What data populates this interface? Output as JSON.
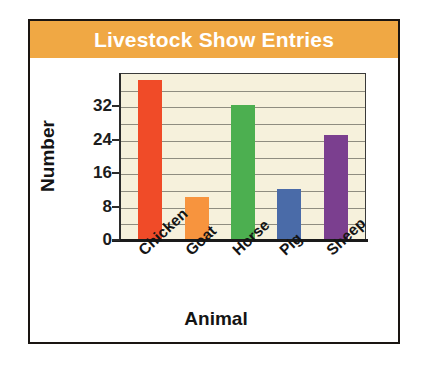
{
  "card": {
    "title": "Livestock Show Entries",
    "title_bar_color": "#F0A844",
    "title_text_color": "#FFFFFF",
    "border_color": "#1A1512",
    "background": "#FFFFFF"
  },
  "chart_data": {
    "type": "bar",
    "title": "Livestock Show Entries",
    "xlabel": "Animal",
    "ylabel": "Number",
    "categories": [
      "Chicken",
      "Goat",
      "Horse",
      "Pig",
      "Sheep"
    ],
    "values": [
      38,
      10,
      32,
      12,
      25
    ],
    "bar_colors": [
      "#F04B28",
      "#F7943E",
      "#4CAF50",
      "#4A6BA8",
      "#7B3F8F"
    ],
    "ytick_labels": [
      "0",
      "8",
      "16",
      "24",
      "32"
    ],
    "ytick_values": [
      0,
      8,
      16,
      24,
      32
    ],
    "ylim": [
      0,
      40
    ],
    "gridline_step": 4,
    "gridlines": [
      4,
      8,
      12,
      16,
      20,
      24,
      28,
      32,
      36
    ],
    "grid": true,
    "legend": "none",
    "plot_background": "#F6F1DC",
    "gridline_color": "#8F8D80",
    "axis_color": "#2B2B2B",
    "xtick_label_rotation": -43
  }
}
